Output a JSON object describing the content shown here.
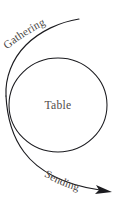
{
  "diagram": {
    "background_color": "#ffffff",
    "stroke_color": "#1b1b1f",
    "text_color": "#4a4644",
    "center": {
      "label": "Table",
      "shape": "circle",
      "cx": 58,
      "cy": 105,
      "rx": 49,
      "ry": 47
    },
    "arcs": [
      {
        "name": "gathering",
        "label": "Gathering",
        "direction": "inbound",
        "start": "top-right",
        "end": "left-of-circle",
        "has_arrowhead": false,
        "label_curvature": "upward-right"
      },
      {
        "name": "sending",
        "label": "Sending",
        "direction": "outbound",
        "start": "left-of-circle",
        "end": "bottom-right",
        "has_arrowhead": true,
        "arrowhead_position": "bottom-right",
        "label_curvature": "downward-right"
      }
    ]
  }
}
